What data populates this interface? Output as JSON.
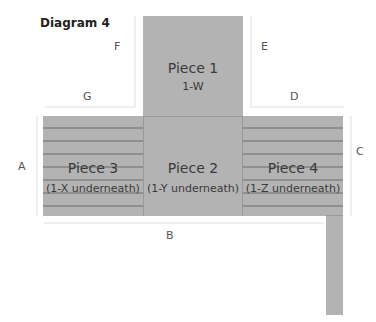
{
  "title": "Diagram 4",
  "pieces": [
    {
      "id": "piece-1",
      "name": "Piece 1",
      "sub": "1-W"
    },
    {
      "id": "piece-2",
      "name": "Piece 2",
      "sub": "(1-Y underneath)"
    },
    {
      "id": "piece-3",
      "name": "Piece 3",
      "sub": "(1-X underneath)"
    },
    {
      "id": "piece-4",
      "name": "Piece 4",
      "sub": "(1-Z underneath)"
    }
  ],
  "edges": {
    "A": "A",
    "B": "B",
    "C": "C",
    "D": "D",
    "E": "E",
    "F": "F",
    "G": "G"
  },
  "colors": {
    "piece_fill": "#b3b3b3",
    "stripe": "#8f8f8f"
  }
}
